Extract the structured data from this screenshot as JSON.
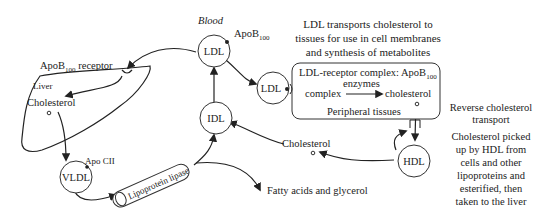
{
  "diagram": {
    "labels": {
      "blood": "Blood",
      "apob100_ldl": "ApoB",
      "apob100_ldl_sub": "100",
      "apob100_receptor": "ApoB",
      "apob100_receptor_sub": "100",
      "apob100_receptor_suffix": " receptor",
      "liver": "Liver",
      "liver_cholesterol": "Cholesterol",
      "apo_cii": "Apo CII",
      "lipoprotein_lipase": "Lipoprotein lipase",
      "fatty_acids": "Fatty acids and glycerol",
      "cholesterol_mid": "Cholesterol",
      "ldl_transport_line1": "LDL transports cholesterol to",
      "ldl_transport_line2": "tissues for use in cell membranes",
      "ldl_transport_line3": "and synthesis of metabolites",
      "box_title": "LDL-receptor complex: ApoB",
      "box_title_sub": "100",
      "box_enzymes": "enzymes",
      "box_complex": "complex",
      "box_cholesterol": "cholesterol",
      "box_peripheral": "Peripheral tissues",
      "reverse_line1": "Reverse cholesterol",
      "reverse_line2": "transport",
      "hdl_desc_line1": "Cholesterol picked",
      "hdl_desc_line2": "up by HDL from",
      "hdl_desc_line3": "cells and other",
      "hdl_desc_line4": "lipoproteins and",
      "hdl_desc_line5": "esterified, then",
      "hdl_desc_line6": "taken to the liver"
    },
    "nodes": {
      "ldl_top": "LDL",
      "ldl_right": "LDL",
      "idl": "IDL",
      "vldl": "VLDL",
      "hdl": "HDL"
    }
  }
}
